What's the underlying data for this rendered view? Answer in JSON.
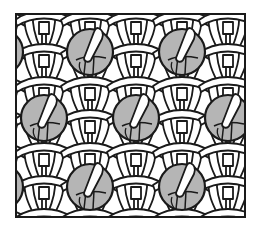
{
  "diagram": {
    "title": "",
    "kind": "knitting stitch pattern (bobbles on stockinette lattice)",
    "canvas": {
      "width": 259,
      "height": 228,
      "background": "#ffffff"
    },
    "frame": {
      "x": 16,
      "y": 14,
      "width": 229,
      "height": 203,
      "stroke": "#1a1a1a",
      "stroke_width": 2
    },
    "colors": {
      "outline": "#1a1a1a",
      "yarn": "#ffffff",
      "bobble": "#b5b5b5"
    },
    "lattice": {
      "column_spacing": 46,
      "row_spacing": 33,
      "origin_x": 21,
      "origin_y": 14,
      "columns": 6,
      "rows": 7
    },
    "bobbles": [
      {
        "cx": 90,
        "cy": 52,
        "r": 23
      },
      {
        "cx": 182,
        "cy": 52,
        "r": 23
      },
      {
        "cx": 0,
        "cy": 52,
        "r": 23
      },
      {
        "cx": 44,
        "cy": 118,
        "r": 23
      },
      {
        "cx": 136,
        "cy": 118,
        "r": 23
      },
      {
        "cx": 228,
        "cy": 118,
        "r": 23
      },
      {
        "cx": 90,
        "cy": 187,
        "r": 23
      },
      {
        "cx": 182,
        "cy": 187,
        "r": 23
      },
      {
        "cx": 0,
        "cy": 187,
        "r": 23
      }
    ]
  }
}
